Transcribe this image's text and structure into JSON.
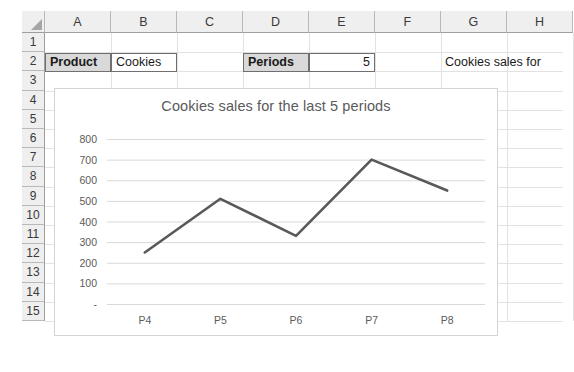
{
  "app": {
    "type": "spreadsheet",
    "corner_icon": "select-all-triangle-icon"
  },
  "grid": {
    "column_headers": [
      "A",
      "B",
      "C",
      "D",
      "E",
      "F",
      "G",
      "H"
    ],
    "row_headers": [
      "1",
      "2",
      "3",
      "4",
      "5",
      "6",
      "7",
      "8",
      "9",
      "10",
      "11",
      "12",
      "13",
      "14",
      "15"
    ]
  },
  "cells": [
    {
      "ref": "A2",
      "value": "Product",
      "style": "header-fill-boxed",
      "align": "left"
    },
    {
      "ref": "B2",
      "value": "Cookies",
      "style": "boxed",
      "align": "left"
    },
    {
      "ref": "D2",
      "value": "Periods",
      "style": "header-fill-boxed",
      "align": "left"
    },
    {
      "ref": "E2",
      "value": "5",
      "style": "boxed",
      "align": "right"
    },
    {
      "ref": "G2",
      "value": "Cookies sales for",
      "style": "plain",
      "align": "left"
    }
  ],
  "chart_data": {
    "type": "line",
    "title": "Cookies sales for the last 5 periods",
    "xlabel": "",
    "ylabel": "",
    "categories": [
      "P4",
      "P5",
      "P6",
      "P7",
      "P8"
    ],
    "values": [
      250,
      510,
      330,
      700,
      550
    ],
    "series": [
      {
        "name": "Cookies sales",
        "values": [
          250,
          510,
          330,
          700,
          550
        ]
      }
    ],
    "ylim": [
      0,
      800
    ],
    "ytick_values": [
      0,
      100,
      200,
      300,
      400,
      500,
      600,
      700,
      800
    ],
    "ytick_labels": [
      "-",
      "100",
      "200",
      "300",
      "400",
      "500",
      "600",
      "700",
      "800"
    ],
    "grid": true,
    "grid_axis": "y",
    "legend": false,
    "legend_position": "none",
    "line_color": "#595959",
    "line_width": 2.6,
    "markers": false,
    "plot_background": "#ffffff",
    "gridline_color": "#d9d9d9",
    "title_color": "#595959",
    "tick_label_color": "#5c5c5c"
  },
  "colors": {
    "header_fill": "#efefef",
    "cell_border": "#6f6f6f",
    "gridline": "#e2e2e2",
    "label_fill": "#d9d9d9",
    "chart_border": "#d4d4d4"
  }
}
